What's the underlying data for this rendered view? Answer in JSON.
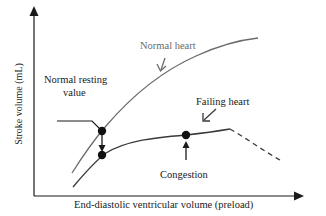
{
  "diagram": {
    "type": "Frank-Starling curves",
    "y_axis_label": "Stroke volume (mL)",
    "x_axis_label": "End-diastolic ventricular volume (preload)",
    "labels": {
      "normal_heart": "Normal heart",
      "failing_heart": "Failing heart",
      "normal_resting_line1": "Normal resting",
      "normal_resting_line2": "value",
      "congestion": "Congestion"
    },
    "colors": {
      "axis": "#1a1a1a",
      "normal_curve": "#6b6b6b",
      "failing_curve": "#3a3a3a",
      "points": "#111111",
      "grey_text": "#6b6b6b",
      "dark_text": "#1a1a1a"
    },
    "points": [
      {
        "name": "normal-resting",
        "x": 102,
        "y": 131
      },
      {
        "name": "failing-resting",
        "x": 102,
        "y": 155
      },
      {
        "name": "congestion",
        "x": 186,
        "y": 135
      }
    ]
  }
}
